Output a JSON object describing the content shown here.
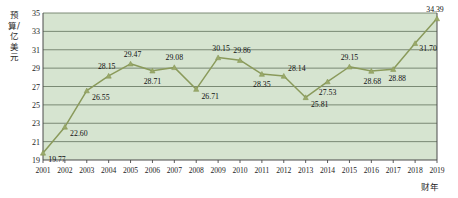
{
  "chart_data": {
    "type": "line",
    "title": "",
    "xlabel": "财年",
    "ylabel": "预算/亿美元",
    "ylim": [
      19,
      35
    ],
    "yticks": [
      19,
      21,
      23,
      25,
      27,
      29,
      31,
      33,
      35
    ],
    "grid": true,
    "legend": "none",
    "categories": [
      "2001",
      "2002",
      "2003",
      "2004",
      "2005",
      "2006",
      "2007",
      "2008",
      "2009",
      "2010",
      "2011",
      "2012",
      "2013",
      "2014",
      "2015",
      "2016",
      "2017",
      "2018",
      "2019"
    ],
    "values": [
      19.77,
      22.6,
      26.55,
      28.15,
      29.47,
      28.71,
      29.08,
      26.71,
      30.15,
      29.86,
      28.35,
      28.14,
      25.81,
      27.53,
      29.15,
      28.68,
      28.88,
      31.7,
      34.39
    ],
    "point_labels": [
      "19.77",
      "22.60",
      "26.55",
      "28.15",
      "29.47",
      "28.71",
      "29.08",
      "26.71",
      "30.15",
      "29.86",
      "28.35",
      "28.14",
      "25.81",
      "27.53",
      "29.15",
      "28.68",
      "28.88",
      "31.70",
      "34.39"
    ],
    "colors": {
      "plot_background": "#d6e4d0",
      "grid_line": "#6f7f6a",
      "series_line": "#8a9a5b",
      "marker": "#9aa96a",
      "axis": "#4a4a4a",
      "text": "#1d1d1d"
    }
  }
}
